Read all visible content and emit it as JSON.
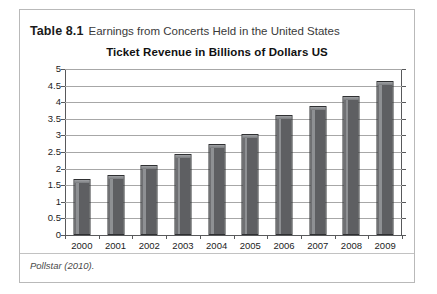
{
  "caption": {
    "label": "Table 8.1",
    "text": "Earnings from Concerts Held in the United States"
  },
  "source": {
    "note": "Pollstar (2010)."
  },
  "colors": {
    "bar_fill": "#5e5f62",
    "bar_border": "#2f3032",
    "bar_highlight": "#8e9093",
    "gridline": "#a7a7a7",
    "axis": "#58595b",
    "frame": "#b9b9b9",
    "text": "#1c1c1c"
  },
  "chart_data": {
    "type": "bar",
    "title": "Ticket Revenue in Billions of Dollars US",
    "xlabel": "",
    "ylabel": "",
    "categories": [
      "2000",
      "2001",
      "2002",
      "2003",
      "2004",
      "2005",
      "2006",
      "2007",
      "2008",
      "2009"
    ],
    "values": [
      1.7,
      1.8,
      2.1,
      2.45,
      2.75,
      3.05,
      3.6,
      3.9,
      4.2,
      4.65
    ],
    "ylim": [
      0,
      5
    ],
    "ytick_values": [
      0,
      0.5,
      1,
      1.5,
      2,
      2.5,
      3,
      3.5,
      4,
      4.5,
      5
    ],
    "ytick_labels": [
      "0",
      "0.5",
      "1",
      "1.5",
      "2",
      "2.5",
      "3",
      "3.5",
      "4",
      "4.5",
      "5"
    ],
    "grid": true,
    "legend": false,
    "legend_position": "none",
    "series": [
      {
        "name": "Ticket Revenue",
        "values": [
          1.7,
          1.8,
          2.1,
          2.45,
          2.75,
          3.05,
          3.6,
          3.9,
          4.2,
          4.65
        ]
      }
    ]
  }
}
